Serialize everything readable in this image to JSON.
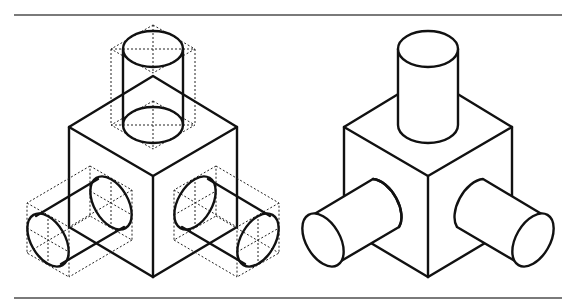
{
  "figure": {
    "panels": [
      {
        "id": "construction",
        "description": "Isometric cube with three cylinders, showing dotted construction boxes and ellipse centerlines"
      },
      {
        "id": "finished",
        "description": "Finished isometric cube with three cylinders (hidden lines removed)"
      }
    ],
    "colors": {
      "line": "#111111",
      "rule": "#7a7a7a",
      "construction": "#222222",
      "background": "#ffffff"
    }
  }
}
